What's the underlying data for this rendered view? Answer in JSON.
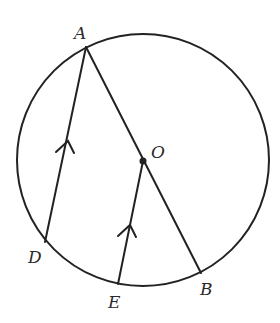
{
  "figure": {
    "type": "circle-geometry",
    "colors": {
      "stroke": "#222222",
      "label": "#2a2a2a",
      "background": "#ffffff"
    },
    "circle": {
      "center_label": "O",
      "cx": 143,
      "cy": 160,
      "r": 126
    },
    "points": {
      "A": {
        "label": "A",
        "x": 86,
        "y": 47
      },
      "B": {
        "label": "B",
        "x": 201,
        "y": 273
      },
      "D": {
        "label": "D",
        "x": 45,
        "y": 242
      },
      "E": {
        "label": "E",
        "x": 118,
        "y": 284
      },
      "O": {
        "label": "O",
        "x": 143,
        "y": 161
      }
    },
    "segments": [
      {
        "name": "AB",
        "from": "A",
        "to": "B",
        "note": "diameter through O"
      },
      {
        "name": "AD",
        "from": "A",
        "to": "D",
        "parallel_mark": true
      },
      {
        "name": "OE",
        "from": "O",
        "to": "E",
        "parallel_mark": true
      }
    ],
    "relation": "AD ∥ OE"
  }
}
